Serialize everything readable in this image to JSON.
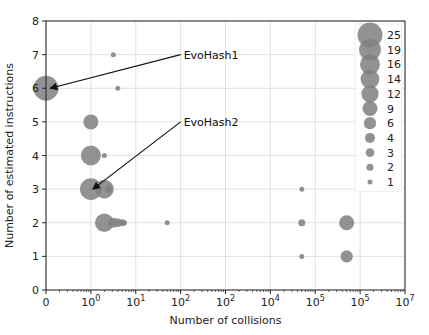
{
  "chart_data": {
    "type": "scatter",
    "title": "",
    "xlabel": "Number of collisions",
    "ylabel": "Number of estimated instructions",
    "xscale": "symlog",
    "x_tick_labels": [
      "0",
      "10^0",
      "10^1",
      "10^2",
      "10^2",
      "10^4",
      "10^5",
      "10^5",
      "10^7"
    ],
    "y_ticks": [
      0,
      1,
      2,
      3,
      4,
      5,
      6,
      7,
      8
    ],
    "ylim": [
      0,
      8
    ],
    "grid": true,
    "marker_color": "#7f7f7f",
    "legend_position": "upper right",
    "legend_title": "",
    "legend_sizes": [
      25,
      19,
      16,
      14,
      12,
      9,
      6,
      4,
      3,
      2,
      1
    ],
    "points": [
      {
        "xpos": 0.0,
        "y": 6,
        "size": 25
      },
      {
        "xpos": 1.6,
        "y": 6,
        "size": 1
      },
      {
        "xpos": 1.5,
        "y": 7,
        "size": 1
      },
      {
        "xpos": 1.0,
        "y": 5,
        "size": 9
      },
      {
        "xpos": 1.0,
        "y": 4,
        "size": 16
      },
      {
        "xpos": 1.3,
        "y": 4,
        "size": 1
      },
      {
        "xpos": 1.0,
        "y": 3,
        "size": 19
      },
      {
        "xpos": 1.3,
        "y": 3,
        "size": 14
      },
      {
        "xpos": 1.4,
        "y": 3,
        "size": 2
      },
      {
        "xpos": 1.3,
        "y": 2,
        "size": 14
      },
      {
        "xpos": 1.5,
        "y": 2,
        "size": 4
      },
      {
        "xpos": 1.6,
        "y": 2,
        "size": 3
      },
      {
        "xpos": 1.7,
        "y": 2,
        "size": 2
      },
      {
        "xpos": 1.75,
        "y": 2,
        "size": 1
      },
      {
        "xpos": 2.7,
        "y": 2,
        "size": 1
      },
      {
        "xpos": 5.7,
        "y": 3,
        "size": 1
      },
      {
        "xpos": 5.7,
        "y": 2,
        "size": 2
      },
      {
        "xpos": 5.7,
        "y": 1,
        "size": 1
      },
      {
        "xpos": 6.7,
        "y": 2,
        "size": 9
      },
      {
        "xpos": 6.7,
        "y": 1,
        "size": 6
      }
    ],
    "annotations": [
      {
        "text": "EvoHash1",
        "target": {
          "xpos": 0.05,
          "y": 6
        },
        "text_pos": {
          "xpos": 3.0,
          "y": 7
        }
      },
      {
        "text": "EvoHash2",
        "target": {
          "xpos": 1.0,
          "y": 3
        },
        "text_pos": {
          "xpos": 3.0,
          "y": 5
        }
      }
    ]
  }
}
